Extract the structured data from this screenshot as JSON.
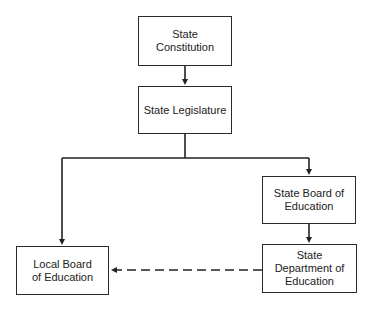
{
  "diagram": {
    "type": "organizational-flowchart",
    "nodes": [
      {
        "id": "constitution",
        "label": "State Constitution"
      },
      {
        "id": "legislature",
        "label": "State Legislature"
      },
      {
        "id": "state_board",
        "label": "State Board of Education"
      },
      {
        "id": "state_dept",
        "label": "State Department of Education"
      },
      {
        "id": "local_board",
        "label": "Local Board of Education"
      }
    ],
    "edges": [
      {
        "from": "constitution",
        "to": "legislature",
        "style": "solid"
      },
      {
        "from": "legislature",
        "to": "local_board",
        "style": "solid"
      },
      {
        "from": "legislature",
        "to": "state_board",
        "style": "solid"
      },
      {
        "from": "state_board",
        "to": "state_dept",
        "style": "solid"
      },
      {
        "from": "state_dept",
        "to": "local_board",
        "style": "dashed"
      }
    ]
  },
  "labels": {
    "constitution": "State Constitution",
    "legislature": "State Legislature",
    "state_board": "State Board of Education",
    "state_dept": "State Department of Education",
    "local_board": "Local Board of Education"
  }
}
